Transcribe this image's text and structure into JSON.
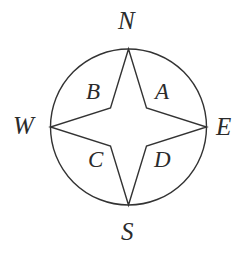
{
  "figure": {
    "name": "compass-rose",
    "background_color": "#ffffff",
    "stroke_color": "#333333",
    "stroke_width": 1.4,
    "circle": {
      "cx": 128.5,
      "cy": 127,
      "r": 78
    },
    "star": {
      "tips": [
        {
          "name": "north-tip",
          "x": 128.5,
          "y": 49
        },
        {
          "name": "east-tip",
          "x": 206.5,
          "y": 127
        },
        {
          "name": "south-tip",
          "x": 128.5,
          "y": 205
        },
        {
          "name": "west-tip",
          "x": 50.5,
          "y": 127
        }
      ],
      "inner_points": [
        {
          "name": "northeast-inner",
          "x": 146.5,
          "y": 108
        },
        {
          "name": "southeast-inner",
          "x": 146.5,
          "y": 146
        },
        {
          "name": "southwest-inner",
          "x": 110.5,
          "y": 146
        },
        {
          "name": "northwest-inner",
          "x": 110.5,
          "y": 108
        }
      ]
    }
  },
  "cardinals": {
    "north": "N",
    "west": "W",
    "east": "E",
    "south": "S"
  },
  "regions": {
    "northeast": "A",
    "northwest": "B",
    "southwest": "C",
    "southeast": "D"
  }
}
